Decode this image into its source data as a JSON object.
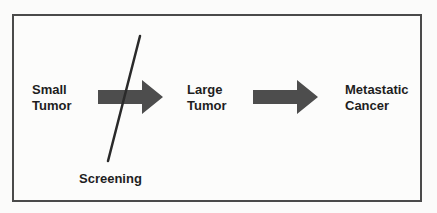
{
  "stages": [
    {
      "label": "Small\nTumor"
    },
    {
      "label": "Large\nTumor"
    },
    {
      "label": "Metastatic\nCancer"
    }
  ],
  "intervention": {
    "label": "Screening"
  },
  "colors": {
    "arrow": "#4d4d4d",
    "line": "#2a2a2a",
    "border": "#4a4a4a",
    "text": "#1e1e1e"
  }
}
